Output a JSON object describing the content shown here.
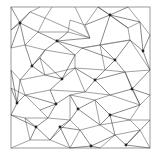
{
  "diagram": {
    "type": "mesh-graph",
    "frame": {
      "x": 11,
      "y": 7,
      "width": 139,
      "height": 141
    },
    "colors": {
      "background": "#ffffff",
      "frame": "#9a9a9a",
      "cells": "#7a7a7a",
      "spokes": "#3a3a3a",
      "nodes": "#222222"
    },
    "nodes": [
      [
        20,
        23
      ],
      [
        110,
        15
      ],
      [
        57,
        41
      ],
      [
        143,
        51
      ],
      [
        115,
        60
      ],
      [
        32,
        66
      ],
      [
        62,
        79
      ],
      [
        95,
        80
      ],
      [
        132,
        89
      ],
      [
        17,
        103
      ],
      [
        56,
        104
      ],
      [
        78,
        109
      ],
      [
        110,
        115
      ],
      [
        36,
        127
      ],
      [
        60,
        127
      ],
      [
        91,
        146
      ],
      [
        126,
        145
      ]
    ],
    "cell_vertices": [
      [
        11,
        7
      ],
      [
        40,
        7
      ],
      [
        52,
        7
      ],
      [
        75,
        7
      ],
      [
        98,
        7
      ],
      [
        128,
        7
      ],
      [
        150,
        7
      ],
      [
        11,
        30
      ],
      [
        30,
        12
      ],
      [
        45,
        18
      ],
      [
        38,
        32
      ],
      [
        70,
        20
      ],
      [
        85,
        25
      ],
      [
        90,
        38
      ],
      [
        68,
        32
      ],
      [
        128,
        28
      ],
      [
        140,
        22
      ],
      [
        150,
        35
      ],
      [
        11,
        48
      ],
      [
        25,
        45
      ],
      [
        45,
        50
      ],
      [
        40,
        58
      ],
      [
        75,
        55
      ],
      [
        82,
        48
      ],
      [
        100,
        45
      ],
      [
        130,
        40
      ],
      [
        125,
        72
      ],
      [
        150,
        70
      ],
      [
        11,
        70
      ],
      [
        20,
        80
      ],
      [
        45,
        75
      ],
      [
        50,
        90
      ],
      [
        75,
        68
      ],
      [
        85,
        92
      ],
      [
        105,
        70
      ],
      [
        110,
        95
      ],
      [
        140,
        105
      ],
      [
        150,
        95
      ],
      [
        11,
        88
      ],
      [
        25,
        95
      ],
      [
        40,
        110
      ],
      [
        70,
        95
      ],
      [
        95,
        100
      ],
      [
        100,
        125
      ],
      [
        130,
        120
      ],
      [
        150,
        120
      ],
      [
        11,
        115
      ],
      [
        25,
        118
      ],
      [
        48,
        118
      ],
      [
        70,
        120
      ],
      [
        80,
        130
      ],
      [
        115,
        135
      ],
      [
        140,
        130
      ],
      [
        150,
        148
      ],
      [
        11,
        148
      ],
      [
        30,
        140
      ],
      [
        50,
        140
      ],
      [
        70,
        148
      ],
      [
        100,
        148
      ]
    ],
    "cell_edges": [
      [
        1,
        8
      ],
      [
        8,
        9
      ],
      [
        9,
        10
      ],
      [
        10,
        19
      ],
      [
        19,
        18
      ],
      [
        8,
        7
      ],
      [
        2,
        9
      ],
      [
        9,
        13
      ],
      [
        13,
        3
      ],
      [
        11,
        12
      ],
      [
        12,
        4
      ],
      [
        11,
        14
      ],
      [
        14,
        10
      ],
      [
        14,
        13
      ],
      [
        12,
        13
      ],
      [
        4,
        15
      ],
      [
        15,
        16
      ],
      [
        16,
        5
      ],
      [
        16,
        17
      ],
      [
        15,
        25
      ],
      [
        25,
        23
      ],
      [
        23,
        22
      ],
      [
        22,
        20
      ],
      [
        20,
        19
      ],
      [
        20,
        21
      ],
      [
        21,
        30
      ],
      [
        30,
        29
      ],
      [
        29,
        28
      ],
      [
        22,
        32
      ],
      [
        32,
        30
      ],
      [
        23,
        24
      ],
      [
        24,
        25
      ],
      [
        24,
        34
      ],
      [
        34,
        32
      ],
      [
        25,
        27
      ],
      [
        26,
        27
      ],
      [
        26,
        34
      ],
      [
        26,
        36
      ],
      [
        36,
        37
      ],
      [
        36,
        35
      ],
      [
        35,
        33
      ],
      [
        33,
        32
      ],
      [
        31,
        33
      ],
      [
        31,
        39
      ],
      [
        39,
        38
      ],
      [
        29,
        39
      ],
      [
        35,
        42
      ],
      [
        42,
        41
      ],
      [
        41,
        33
      ],
      [
        42,
        43
      ],
      [
        43,
        44
      ],
      [
        44,
        45
      ],
      [
        36,
        44
      ],
      [
        40,
        39
      ],
      [
        40,
        48
      ],
      [
        48,
        47
      ],
      [
        47,
        46
      ],
      [
        41,
        49
      ],
      [
        49,
        48
      ],
      [
        49,
        50
      ],
      [
        50,
        43
      ],
      [
        43,
        51
      ],
      [
        51,
        52
      ],
      [
        52,
        53
      ],
      [
        52,
        44
      ],
      [
        50,
        57
      ],
      [
        51,
        58
      ],
      [
        47,
        55
      ],
      [
        55,
        54
      ],
      [
        55,
        56
      ],
      [
        56,
        49
      ],
      [
        56,
        57
      ]
    ],
    "spokes": [
      [
        0,
        0
      ],
      [
        0,
        8
      ],
      [
        0,
        10
      ],
      [
        0,
        7
      ],
      [
        0,
        18
      ],
      [
        0,
        19
      ],
      [
        1,
        4
      ],
      [
        1,
        12
      ],
      [
        1,
        5
      ],
      [
        1,
        16
      ],
      [
        1,
        15
      ],
      [
        1,
        24
      ],
      [
        2,
        14
      ],
      [
        2,
        10
      ],
      [
        2,
        20
      ],
      [
        2,
        22
      ],
      [
        2,
        23
      ],
      [
        2,
        13
      ],
      [
        3,
        17
      ],
      [
        3,
        25
      ],
      [
        3,
        27
      ],
      [
        3,
        16
      ],
      [
        4,
        24
      ],
      [
        4,
        25
      ],
      [
        4,
        26
      ],
      [
        4,
        34
      ],
      [
        4,
        23
      ],
      [
        5,
        19
      ],
      [
        5,
        21
      ],
      [
        5,
        29
      ],
      [
        5,
        30
      ],
      [
        5,
        20
      ],
      [
        6,
        21
      ],
      [
        6,
        22
      ],
      [
        6,
        32
      ],
      [
        6,
        31
      ],
      [
        6,
        30
      ],
      [
        7,
        32
      ],
      [
        7,
        34
      ],
      [
        7,
        35
      ],
      [
        7,
        33
      ],
      [
        7,
        26
      ],
      [
        8,
        26
      ],
      [
        8,
        27
      ],
      [
        8,
        37
      ],
      [
        8,
        36
      ],
      [
        8,
        35
      ],
      [
        9,
        28
      ],
      [
        9,
        38
      ],
      [
        9,
        39
      ],
      [
        9,
        46
      ],
      [
        9,
        29
      ],
      [
        10,
        31
      ],
      [
        10,
        40
      ],
      [
        10,
        41
      ],
      [
        10,
        48
      ],
      [
        10,
        39
      ],
      [
        11,
        41
      ],
      [
        11,
        42
      ],
      [
        11,
        49
      ],
      [
        11,
        43
      ],
      [
        12,
        42
      ],
      [
        12,
        43
      ],
      [
        12,
        44
      ],
      [
        12,
        36
      ],
      [
        12,
        51
      ],
      [
        13,
        47
      ],
      [
        13,
        48
      ],
      [
        13,
        55
      ],
      [
        13,
        56
      ],
      [
        13,
        46
      ],
      [
        14,
        49
      ],
      [
        14,
        50
      ],
      [
        14,
        56
      ],
      [
        14,
        57
      ],
      [
        15,
        57
      ],
      [
        15,
        50
      ],
      [
        15,
        58
      ],
      [
        15,
        51
      ],
      [
        16,
        52
      ],
      [
        16,
        51
      ],
      [
        16,
        53
      ],
      [
        16,
        45
      ]
    ]
  }
}
